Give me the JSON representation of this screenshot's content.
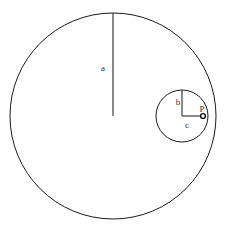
{
  "figure": {
    "background_color": "#ffffff",
    "stroke_color": "#1a1a1a",
    "label_color": "#333333",
    "width": 225,
    "height": 234
  },
  "chart_data": {
    "type": "diagram",
    "title": "",
    "xlabel": "",
    "ylabel": "",
    "grid": false,
    "legend": null,
    "shapes": [
      {
        "name": "large-circle",
        "kind": "circle",
        "cx": 113,
        "cy": 116,
        "r": 103,
        "stroke": "#1a1a1a",
        "fill": "none"
      },
      {
        "name": "small-circle",
        "kind": "circle",
        "cx": 182,
        "cy": 116,
        "r": 26,
        "stroke": "#1a1a1a",
        "fill": "none"
      },
      {
        "name": "radius-a-line",
        "kind": "line",
        "x1": 113,
        "y1": 116,
        "x2": 113,
        "y2": 13,
        "stroke": "#2b2b2b"
      },
      {
        "name": "radius-b-line",
        "kind": "line",
        "x1": 182,
        "y1": 116,
        "x2": 182,
        "y2": 90,
        "stroke": "#2b2b2b"
      },
      {
        "name": "segment-c-line",
        "kind": "line",
        "x1": 182,
        "y1": 116,
        "x2": 203,
        "y2": 116,
        "stroke": "#2b2b2b"
      },
      {
        "name": "point-p-marker",
        "kind": "point",
        "cx": 203,
        "cy": 116,
        "r": 2.4,
        "stroke": "#111111",
        "fill": "#ffffff"
      }
    ],
    "annotations": [
      {
        "name": "label-a",
        "text": "a",
        "x": 103,
        "y": 71
      },
      {
        "name": "label-b",
        "text": "b",
        "x": 178,
        "y": 105
      },
      {
        "name": "label-c",
        "text": "c",
        "x": 187,
        "y": 128
      },
      {
        "name": "label-p",
        "text": "P",
        "x": 202,
        "y": 112
      }
    ]
  },
  "labels": {
    "a": "a",
    "b": "b",
    "c": "c",
    "p": "P"
  }
}
